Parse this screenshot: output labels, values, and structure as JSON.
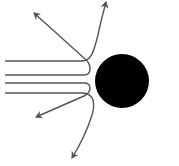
{
  "diagram": {
    "type": "scattering-trajectories",
    "background": "#ffffff",
    "nucleus": {
      "cx": 122,
      "cy": 81,
      "r": 27,
      "color": "#000000"
    },
    "trajectory_color": "#555555",
    "trajectories": [
      {
        "name": "trajectory-deflect-up-steep",
        "d": "M5,61 L82,61 C92,61 94,50 98,35 C101,20 104,10 106,2"
      },
      {
        "name": "trajectory-backscatter-up",
        "d": "M5,75 L84,75 C92,75 92,64 84,58 L34,13"
      },
      {
        "name": "trajectory-backscatter-down",
        "d": "M5,83 L84,83 C92,83 92,92 84,96 L36,117"
      },
      {
        "name": "trajectory-deflect-down-steep",
        "d": "M5,93 L82,93 C95,93 95,105 92,115 C88,128 80,145 72,158"
      }
    ]
  }
}
